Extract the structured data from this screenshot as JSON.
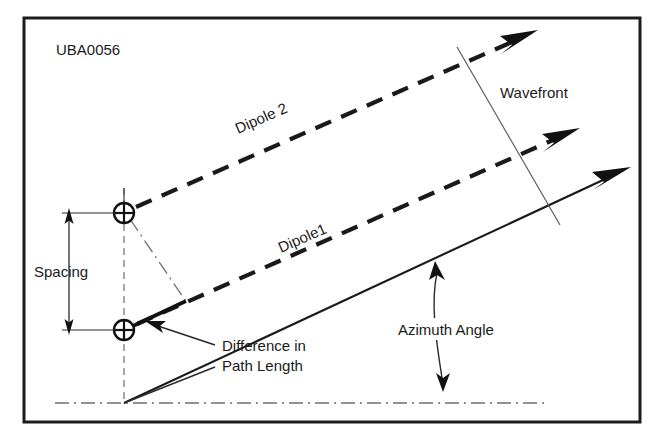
{
  "figure": {
    "id_label": "UBA0056",
    "labels": {
      "dipole2": "Dipole 2",
      "dipole1": "Dipole1",
      "wavefront": "Wavefront",
      "spacing": "Spacing",
      "difference_line1": "Difference in",
      "difference_line2": "Path Length",
      "azimuth": "Azimuth Angle"
    },
    "colors": {
      "ink": "#1a1a1a",
      "frame": "#1c1c1c",
      "thin": "#5a5a5a",
      "background": "#ffffff"
    },
    "elements": {
      "dipole_marker": "circle-plus",
      "ray_style": "dashed-with-arrowhead",
      "azimuth_ray_style": "solid-with-arrowhead",
      "baseline_style": "dash-dot",
      "wavefront_style": "thin-perpendicular-line"
    }
  }
}
